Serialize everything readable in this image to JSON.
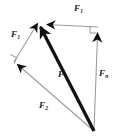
{
  "figure": {
    "kind": "force-vector-decomposition-diagram",
    "background_color": "#ffffff",
    "width": 116,
    "height": 140
  },
  "labels": {
    "f1_top": {
      "base": "F",
      "sub": "1"
    },
    "f1_left": {
      "base": "F",
      "sub": "1"
    },
    "fn_right": {
      "base": "F",
      "sub": "n"
    },
    "f2_bottom": {
      "base": "F",
      "sub": "2"
    },
    "f_resultant": {
      "base": "F",
      "sub": ""
    }
  },
  "colors": {
    "resultant_stroke": "#111111",
    "component_stroke": "#9a9a9a",
    "arrowhead_fill": "#111111",
    "right_angle_stroke": "#7a7a7a",
    "label_text": "#1a1a1a"
  },
  "geometry": {
    "origin": {
      "x": 94,
      "y": 131
    },
    "apex": {
      "x": 40,
      "y": 22
    },
    "top_right_corner": {
      "x": 98,
      "y": 28
    },
    "left_vertex": {
      "x": 14,
      "y": 62
    },
    "resultant_tip": {
      "x": 38,
      "y": 20
    }
  },
  "vectors": [
    {
      "name": "resultant-force",
      "label_key": "f_resultant",
      "style": "bold-black",
      "from": {
        "x": 94,
        "y": 131
      },
      "to": {
        "x": 38,
        "y": 20
      }
    },
    {
      "name": "component-f1-horizontal",
      "label_key": "f1_top",
      "style": "thin-gray",
      "from": {
        "x": 98,
        "y": 28
      },
      "to": {
        "x": 44,
        "y": 24
      }
    },
    {
      "name": "component-fn-vertical",
      "label_key": "fn_right",
      "style": "thin-gray",
      "from": {
        "x": 94,
        "y": 131
      },
      "to": {
        "x": 98,
        "y": 28
      }
    },
    {
      "name": "component-f1-diagonal-upper-left",
      "label_key": "f1_left",
      "style": "thin-gray",
      "from": {
        "x": 14,
        "y": 62
      },
      "to": {
        "x": 36,
        "y": 24
      }
    },
    {
      "name": "component-f2-diagonal-lower",
      "label_key": "f2_bottom",
      "style": "thin-gray",
      "from": {
        "x": 94,
        "y": 131
      },
      "to": {
        "x": 14,
        "y": 62
      }
    }
  ],
  "right_angle_marks": [
    {
      "name": "right-angle-top-right",
      "x": 84,
      "y": 26
    },
    {
      "name": "right-angle-left-vertex",
      "x": 14,
      "y": 56
    }
  ]
}
